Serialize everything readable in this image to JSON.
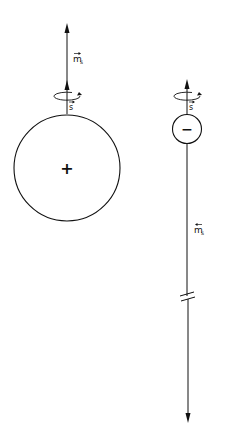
{
  "diagram": {
    "proton": {
      "charge_sign": "+",
      "spin_label": "s",
      "moment_label": "m",
      "moment_subscript": "s"
    },
    "electron": {
      "charge_sign": "−",
      "spin_label": "s",
      "moment_label": "m",
      "moment_subscript": "s"
    },
    "colors": {
      "ink": "#111111",
      "background": "#ffffff"
    }
  }
}
